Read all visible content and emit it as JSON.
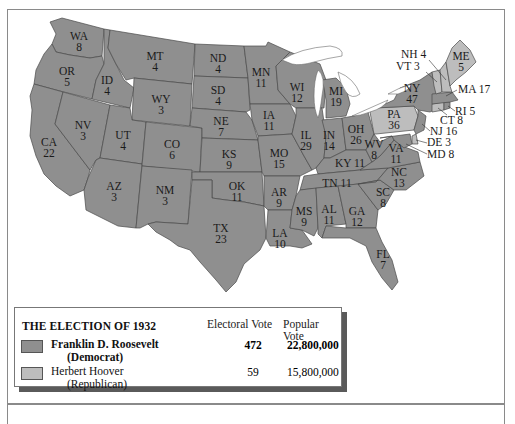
{
  "legend": {
    "title": "THE ELECTION OF 1932",
    "col_electoral": "Electoral Vote",
    "col_popular": "Popular Vote",
    "candidates": [
      {
        "name": "Franklin D. Roosevelt",
        "party": "(Democrat)",
        "electoral": "472",
        "popular": "22,800,000",
        "color": "#8f8f8f",
        "bold": true
      },
      {
        "name": "Herbert Hoover",
        "party": "(Republican)",
        "electoral": "59",
        "popular": "15,800,000",
        "color": "#bdbdbd",
        "bold": false
      }
    ]
  },
  "colors": {
    "democrat": "#8f8f8f",
    "republican": "#bdbdbd",
    "water": "#ffffff"
  },
  "states": {
    "WA": {
      "abbr": "WA",
      "ev": "8",
      "winner": "democrat"
    },
    "OR": {
      "abbr": "OR",
      "ev": "5",
      "winner": "democrat"
    },
    "CA": {
      "abbr": "CA",
      "ev": "22",
      "winner": "democrat"
    },
    "ID": {
      "abbr": "ID",
      "ev": "4",
      "winner": "democrat"
    },
    "NV": {
      "abbr": "NV",
      "ev": "3",
      "winner": "democrat"
    },
    "MT": {
      "abbr": "MT",
      "ev": "4",
      "winner": "democrat"
    },
    "WY": {
      "abbr": "WY",
      "ev": "3",
      "winner": "democrat"
    },
    "UT": {
      "abbr": "UT",
      "ev": "4",
      "winner": "democrat"
    },
    "AZ": {
      "abbr": "AZ",
      "ev": "3",
      "winner": "democrat"
    },
    "CO": {
      "abbr": "CO",
      "ev": "6",
      "winner": "democrat"
    },
    "NM": {
      "abbr": "NM",
      "ev": "3",
      "winner": "democrat"
    },
    "ND": {
      "abbr": "ND",
      "ev": "4",
      "winner": "democrat"
    },
    "SD": {
      "abbr": "SD",
      "ev": "4",
      "winner": "democrat"
    },
    "NE": {
      "abbr": "NE",
      "ev": "7",
      "winner": "democrat"
    },
    "KS": {
      "abbr": "KS",
      "ev": "9",
      "winner": "democrat"
    },
    "OK": {
      "abbr": "OK",
      "ev": "11",
      "winner": "democrat"
    },
    "TX": {
      "abbr": "TX",
      "ev": "23",
      "winner": "democrat"
    },
    "MN": {
      "abbr": "MN",
      "ev": "11",
      "winner": "democrat"
    },
    "IA": {
      "abbr": "IA",
      "ev": "11",
      "winner": "democrat"
    },
    "MO": {
      "abbr": "MO",
      "ev": "15",
      "winner": "democrat"
    },
    "AR": {
      "abbr": "AR",
      "ev": "9",
      "winner": "democrat"
    },
    "LA": {
      "abbr": "LA",
      "ev": "10",
      "winner": "democrat"
    },
    "WI": {
      "abbr": "WI",
      "ev": "12",
      "winner": "democrat"
    },
    "IL": {
      "abbr": "IL",
      "ev": "29",
      "winner": "democrat"
    },
    "MI": {
      "abbr": "MI",
      "ev": "19",
      "winner": "democrat"
    },
    "IN": {
      "abbr": "IN",
      "ev": "14",
      "winner": "democrat"
    },
    "OH": {
      "abbr": "OH",
      "ev": "26",
      "winner": "democrat"
    },
    "KY": {
      "abbr": "KY",
      "ev": "11",
      "winner": "democrat"
    },
    "TN": {
      "abbr": "TN",
      "ev": "11",
      "winner": "democrat"
    },
    "MS": {
      "abbr": "MS",
      "ev": "9",
      "winner": "democrat"
    },
    "AL": {
      "abbr": "AL",
      "ev": "11",
      "winner": "democrat"
    },
    "GA": {
      "abbr": "GA",
      "ev": "12",
      "winner": "democrat"
    },
    "FL": {
      "abbr": "FL",
      "ev": "7",
      "winner": "democrat"
    },
    "SC": {
      "abbr": "SC",
      "ev": "8",
      "winner": "democrat"
    },
    "NC": {
      "abbr": "NC",
      "ev": "13",
      "winner": "democrat"
    },
    "VA": {
      "abbr": "VA",
      "ev": "11",
      "winner": "democrat"
    },
    "WV": {
      "abbr": "WV",
      "ev": "8",
      "winner": "democrat"
    },
    "PA": {
      "abbr": "PA",
      "ev": "36",
      "winner": "republican"
    },
    "NY": {
      "abbr": "NY",
      "ev": "47",
      "winner": "democrat"
    },
    "NJ": {
      "abbr": "NJ",
      "ev": "16",
      "winner": "democrat",
      "label": "NJ 16"
    },
    "DE": {
      "abbr": "DE",
      "ev": "3",
      "winner": "republican",
      "label": "DE 3"
    },
    "MD": {
      "abbr": "MD",
      "ev": "8",
      "winner": "democrat",
      "label": "MD 8"
    },
    "CT": {
      "abbr": "CT",
      "ev": "8",
      "winner": "republican",
      "label": "CT 8"
    },
    "RI": {
      "abbr": "RI",
      "ev": "5",
      "winner": "democrat",
      "label": "RI 5"
    },
    "MA": {
      "abbr": "MA",
      "ev": "17",
      "winner": "democrat",
      "label": "MA 17"
    },
    "VT": {
      "abbr": "VT",
      "ev": "3",
      "winner": "republican",
      "label": "VT 3"
    },
    "NH": {
      "abbr": "NH",
      "ev": "4",
      "winner": "republican",
      "label": "NH 4"
    },
    "ME": {
      "abbr": "ME",
      "ev": "5",
      "winner": "republican"
    }
  }
}
